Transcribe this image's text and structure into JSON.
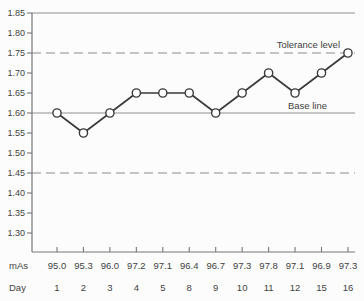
{
  "chart_data": {
    "type": "line",
    "title": "",
    "xlabel": "",
    "ylabel": "",
    "ylim": [
      1.3,
      1.85
    ],
    "ytick_step": 0.05,
    "yticks": [
      "1.85",
      "1.80",
      "1.75",
      "1.70",
      "1.65",
      "1.60",
      "1.55",
      "1.50",
      "1.45",
      "1.40",
      "1.35",
      "1.30"
    ],
    "x_axis_rows": [
      {
        "label": "mAs",
        "values": [
          "95.0",
          "95.3",
          "96.0",
          "97.2",
          "97.1",
          "96.4",
          "96.7",
          "97.3",
          "97.8",
          "97.1",
          "96.9",
          "97.3"
        ]
      },
      {
        "label": "Day",
        "values": [
          "1",
          "2",
          "3",
          "4",
          "5",
          "8",
          "9",
          "10",
          "11",
          "12",
          "15",
          "16"
        ]
      }
    ],
    "series": [
      {
        "name": "density-readings",
        "values": [
          1.6,
          1.55,
          1.6,
          1.65,
          1.65,
          1.65,
          1.6,
          1.65,
          1.7,
          1.65,
          1.7,
          1.75
        ]
      }
    ],
    "reference_lines": [
      {
        "value": 1.85,
        "style": "solid",
        "label": ""
      },
      {
        "value": 1.75,
        "style": "dashed",
        "label": "Tolerance level"
      },
      {
        "value": 1.6,
        "style": "solid",
        "label": "Base line"
      },
      {
        "value": 1.45,
        "style": "dashed",
        "label": ""
      }
    ],
    "annotations": {
      "tolerance_label": "Tolerance level",
      "baseline_label": "Base line"
    },
    "legend": false,
    "grid": false
  },
  "colors": {
    "background": "#fcfcfc",
    "axis": "#777777",
    "reference_solid": "#8f8f8f",
    "reference_dashed": "#8c8c8c",
    "data_line": "#3a3a3a",
    "marker_fill": "#ffffff",
    "marker_stroke": "#3a3a3a",
    "text": "#3f3f3f"
  }
}
